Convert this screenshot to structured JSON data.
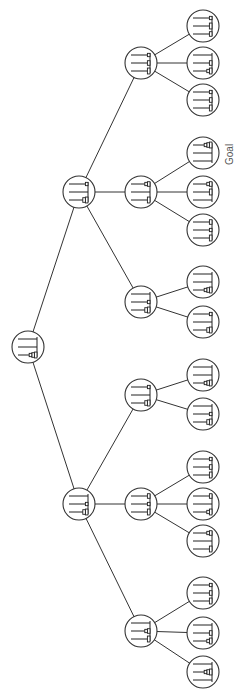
{
  "diagram": {
    "type": "search-tree",
    "orientation": "rotated-90",
    "goal_label": "Goal",
    "node_radius": 16,
    "nodes": [
      {
        "id": "root",
        "x": 28,
        "y": 347,
        "pegs": [
          [],
          [],
          [
            3,
            2,
            1
          ]
        ]
      },
      {
        "id": "a",
        "x": 79,
        "y": 192,
        "pegs": [
          [
            1
          ],
          [],
          [
            3,
            2
          ]
        ],
        "parent": "root"
      },
      {
        "id": "b",
        "x": 79,
        "y": 504,
        "pegs": [
          [],
          [
            1
          ],
          [
            3,
            2
          ]
        ],
        "parent": "root"
      },
      {
        "id": "a1",
        "x": 141,
        "y": 63,
        "pegs": [
          [
            1
          ],
          [
            2
          ],
          [
            3
          ]
        ],
        "parent": "a"
      },
      {
        "id": "a2",
        "x": 141,
        "y": 192,
        "pegs": [
          [
            2,
            1
          ],
          [],
          [
            3
          ]
        ],
        "parent": "a"
      },
      {
        "id": "a3",
        "x": 141,
        "y": 302,
        "pegs": [
          [],
          [
            1
          ],
          [
            3,
            2
          ]
        ],
        "parent": "a"
      },
      {
        "id": "b1",
        "x": 141,
        "y": 395,
        "pegs": [
          [
            1
          ],
          [],
          [
            3,
            2
          ]
        ],
        "parent": "b"
      },
      {
        "id": "b2",
        "x": 141,
        "y": 504,
        "pegs": [
          [
            2
          ],
          [
            1
          ],
          [
            3
          ]
        ],
        "parent": "b"
      },
      {
        "id": "b3",
        "x": 141,
        "y": 631,
        "pegs": [
          [],
          [
            2,
            1
          ],
          [
            3
          ]
        ],
        "parent": "b"
      },
      {
        "id": "a1a",
        "x": 203,
        "y": 26,
        "pegs": [
          [
            1
          ],
          [
            3
          ],
          [
            2
          ]
        ],
        "parent": "a1"
      },
      {
        "id": "a1b",
        "x": 203,
        "y": 63,
        "pegs": [
          [],
          [
            2
          ],
          [
            3,
            1
          ]
        ],
        "parent": "a1"
      },
      {
        "id": "a1c",
        "x": 203,
        "y": 100,
        "pegs": [
          [
            1
          ],
          [
            2
          ],
          [
            3
          ]
        ],
        "parent": "a1"
      },
      {
        "id": "a2a",
        "x": 203,
        "y": 153,
        "pegs": [
          [
            3,
            2,
            1
          ],
          [],
          []
        ],
        "parent": "a2",
        "goal": true
      },
      {
        "id": "a2b",
        "x": 203,
        "y": 192,
        "pegs": [
          [
            2,
            1
          ],
          [
            3
          ],
          []
        ],
        "parent": "a2"
      },
      {
        "id": "a2c",
        "x": 203,
        "y": 230,
        "pegs": [
          [
            2
          ],
          [
            1
          ],
          [
            3
          ]
        ],
        "parent": "a2"
      },
      {
        "id": "a3a",
        "x": 203,
        "y": 282,
        "pegs": [
          [],
          [],
          [
            3,
            2,
            1
          ]
        ],
        "parent": "a3"
      },
      {
        "id": "a3b",
        "x": 203,
        "y": 322,
        "pegs": [
          [
            1
          ],
          [],
          [
            3,
            2
          ]
        ],
        "parent": "a3"
      },
      {
        "id": "b1a",
        "x": 203,
        "y": 375,
        "pegs": [
          [],
          [],
          [
            3,
            2,
            1
          ]
        ],
        "parent": "b1"
      },
      {
        "id": "b1b",
        "x": 203,
        "y": 414,
        "pegs": [
          [],
          [
            1
          ],
          [
            3,
            2
          ]
        ],
        "parent": "b1"
      },
      {
        "id": "b2a",
        "x": 203,
        "y": 467,
        "pegs": [
          [
            1
          ],
          [
            2
          ],
          [
            3
          ]
        ],
        "parent": "b2"
      },
      {
        "id": "b2b",
        "x": 203,
        "y": 504,
        "pegs": [
          [
            2
          ],
          [],
          [
            3,
            1
          ]
        ],
        "parent": "b2"
      },
      {
        "id": "b2c",
        "x": 203,
        "y": 541,
        "pegs": [
          [
            2,
            1
          ],
          [],
          [
            3
          ]
        ],
        "parent": "b2"
      },
      {
        "id": "b3a",
        "x": 203,
        "y": 593,
        "pegs": [
          [
            1
          ],
          [
            2
          ],
          [
            3
          ]
        ],
        "parent": "b3"
      },
      {
        "id": "b3b",
        "x": 203,
        "y": 633,
        "pegs": [
          [],
          [
            2
          ],
          [
            3,
            1
          ]
        ],
        "parent": "b3"
      },
      {
        "id": "b3c",
        "x": 203,
        "y": 672,
        "pegs": [
          [],
          [
            3,
            2,
            1
          ],
          []
        ],
        "parent": "b3"
      }
    ]
  }
}
